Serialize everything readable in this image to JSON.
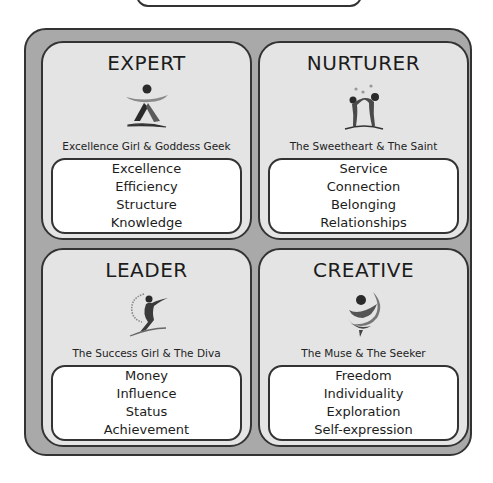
{
  "quadrants": [
    {
      "title": "EXPERT",
      "icon": "expert-figure-icon",
      "subtitle": "Excellence Girl & Goddess Geek",
      "values": [
        "Excellence",
        "Efficiency",
        "Structure",
        "Knowledge"
      ]
    },
    {
      "title": "NURTURER",
      "icon": "nurturer-figures-icon",
      "subtitle": "The Sweetheart & The Saint",
      "values": [
        "Service",
        "Connection",
        "Belonging",
        "Relationships"
      ]
    },
    {
      "title": "LEADER",
      "icon": "leader-figure-icon",
      "subtitle": "The Success Girl & The Diva",
      "values": [
        "Money",
        "Influence",
        "Status",
        "Achievement"
      ]
    },
    {
      "title": "CREATIVE",
      "icon": "creative-swirl-icon",
      "subtitle": "The Muse & The Seeker",
      "values": [
        "Freedom",
        "Individuality",
        "Exploration",
        "Self-expression"
      ]
    }
  ]
}
